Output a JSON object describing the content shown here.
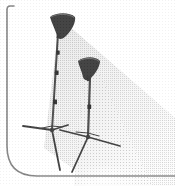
{
  "figure": {
    "title": "Two studio light stands with cone reflector lamp heads casting a light beam",
    "caption": "",
    "width": 175,
    "height": 186,
    "background_color": "#ffffff",
    "style": "grainy black-and-white scanned line illustration with halftone dither shading"
  },
  "frame": {
    "name": "partial rounded rectangle border",
    "stroke_color": "#6e6e6e",
    "stroke_width": 1.6,
    "corner_radius": 30,
    "left_edge_x": 7,
    "top_edge_y": 6,
    "top_stub_end_x": 14,
    "bottom_edge_y": 176,
    "bottom_edge_end_x": 175,
    "bottom_dashed": true
  },
  "beam": {
    "name": "light beam cone",
    "color_near": "#d6d6d6",
    "color_far": "#f2f2f2",
    "origin_x": 61,
    "origin_y": 27,
    "direction": "down-right",
    "opacity": 0.95
  },
  "lamps": [
    {
      "id": "lamp-stand-rear",
      "label": "Rear light stand",
      "head_x": 61,
      "head_y": 25,
      "head_width": 26,
      "head_height": 19,
      "head_color": "#1a1a1a",
      "head_tilt_deg": -22,
      "pole_top_x": 58,
      "pole_top_y": 33,
      "pole_bottom_x": 52,
      "pole_bottom_y": 130,
      "pole_color": "#2a2a2a",
      "pole_width": 2.0,
      "clamps": [
        {
          "y": 52
        },
        {
          "y": 72
        },
        {
          "y": 101
        }
      ],
      "tripod": {
        "hub_x": 52,
        "hub_y": 130,
        "legs": [
          {
            "x": 23,
            "y": 126
          },
          {
            "x": 68,
            "y": 125
          },
          {
            "x": 60,
            "y": 170
          }
        ],
        "color": "#1f1f1f",
        "width": 1.8
      }
    },
    {
      "id": "lamp-stand-front",
      "label": "Front light stand",
      "head_x": 88,
      "head_y": 68,
      "head_width": 22,
      "head_height": 17,
      "head_color": "#1a1a1a",
      "head_tilt_deg": -20,
      "pole_top_x": 90,
      "pole_top_y": 77,
      "pole_bottom_x": 88,
      "pole_bottom_y": 137,
      "pole_color": "#2a2a2a",
      "pole_width": 2.2,
      "clamps": [
        {
          "y": 106
        }
      ],
      "tripod": {
        "hub_x": 88,
        "hub_y": 137,
        "legs": [
          {
            "x": 60,
            "y": 130
          },
          {
            "x": 120,
            "y": 146
          },
          {
            "x": 72,
            "y": 172
          }
        ],
        "color": "#1f1f1f",
        "width": 1.8
      }
    }
  ],
  "texture": {
    "name": "halftone dither grain",
    "dot_color": "#b9b9b9",
    "dot_spacing": 2,
    "enabled": true
  }
}
